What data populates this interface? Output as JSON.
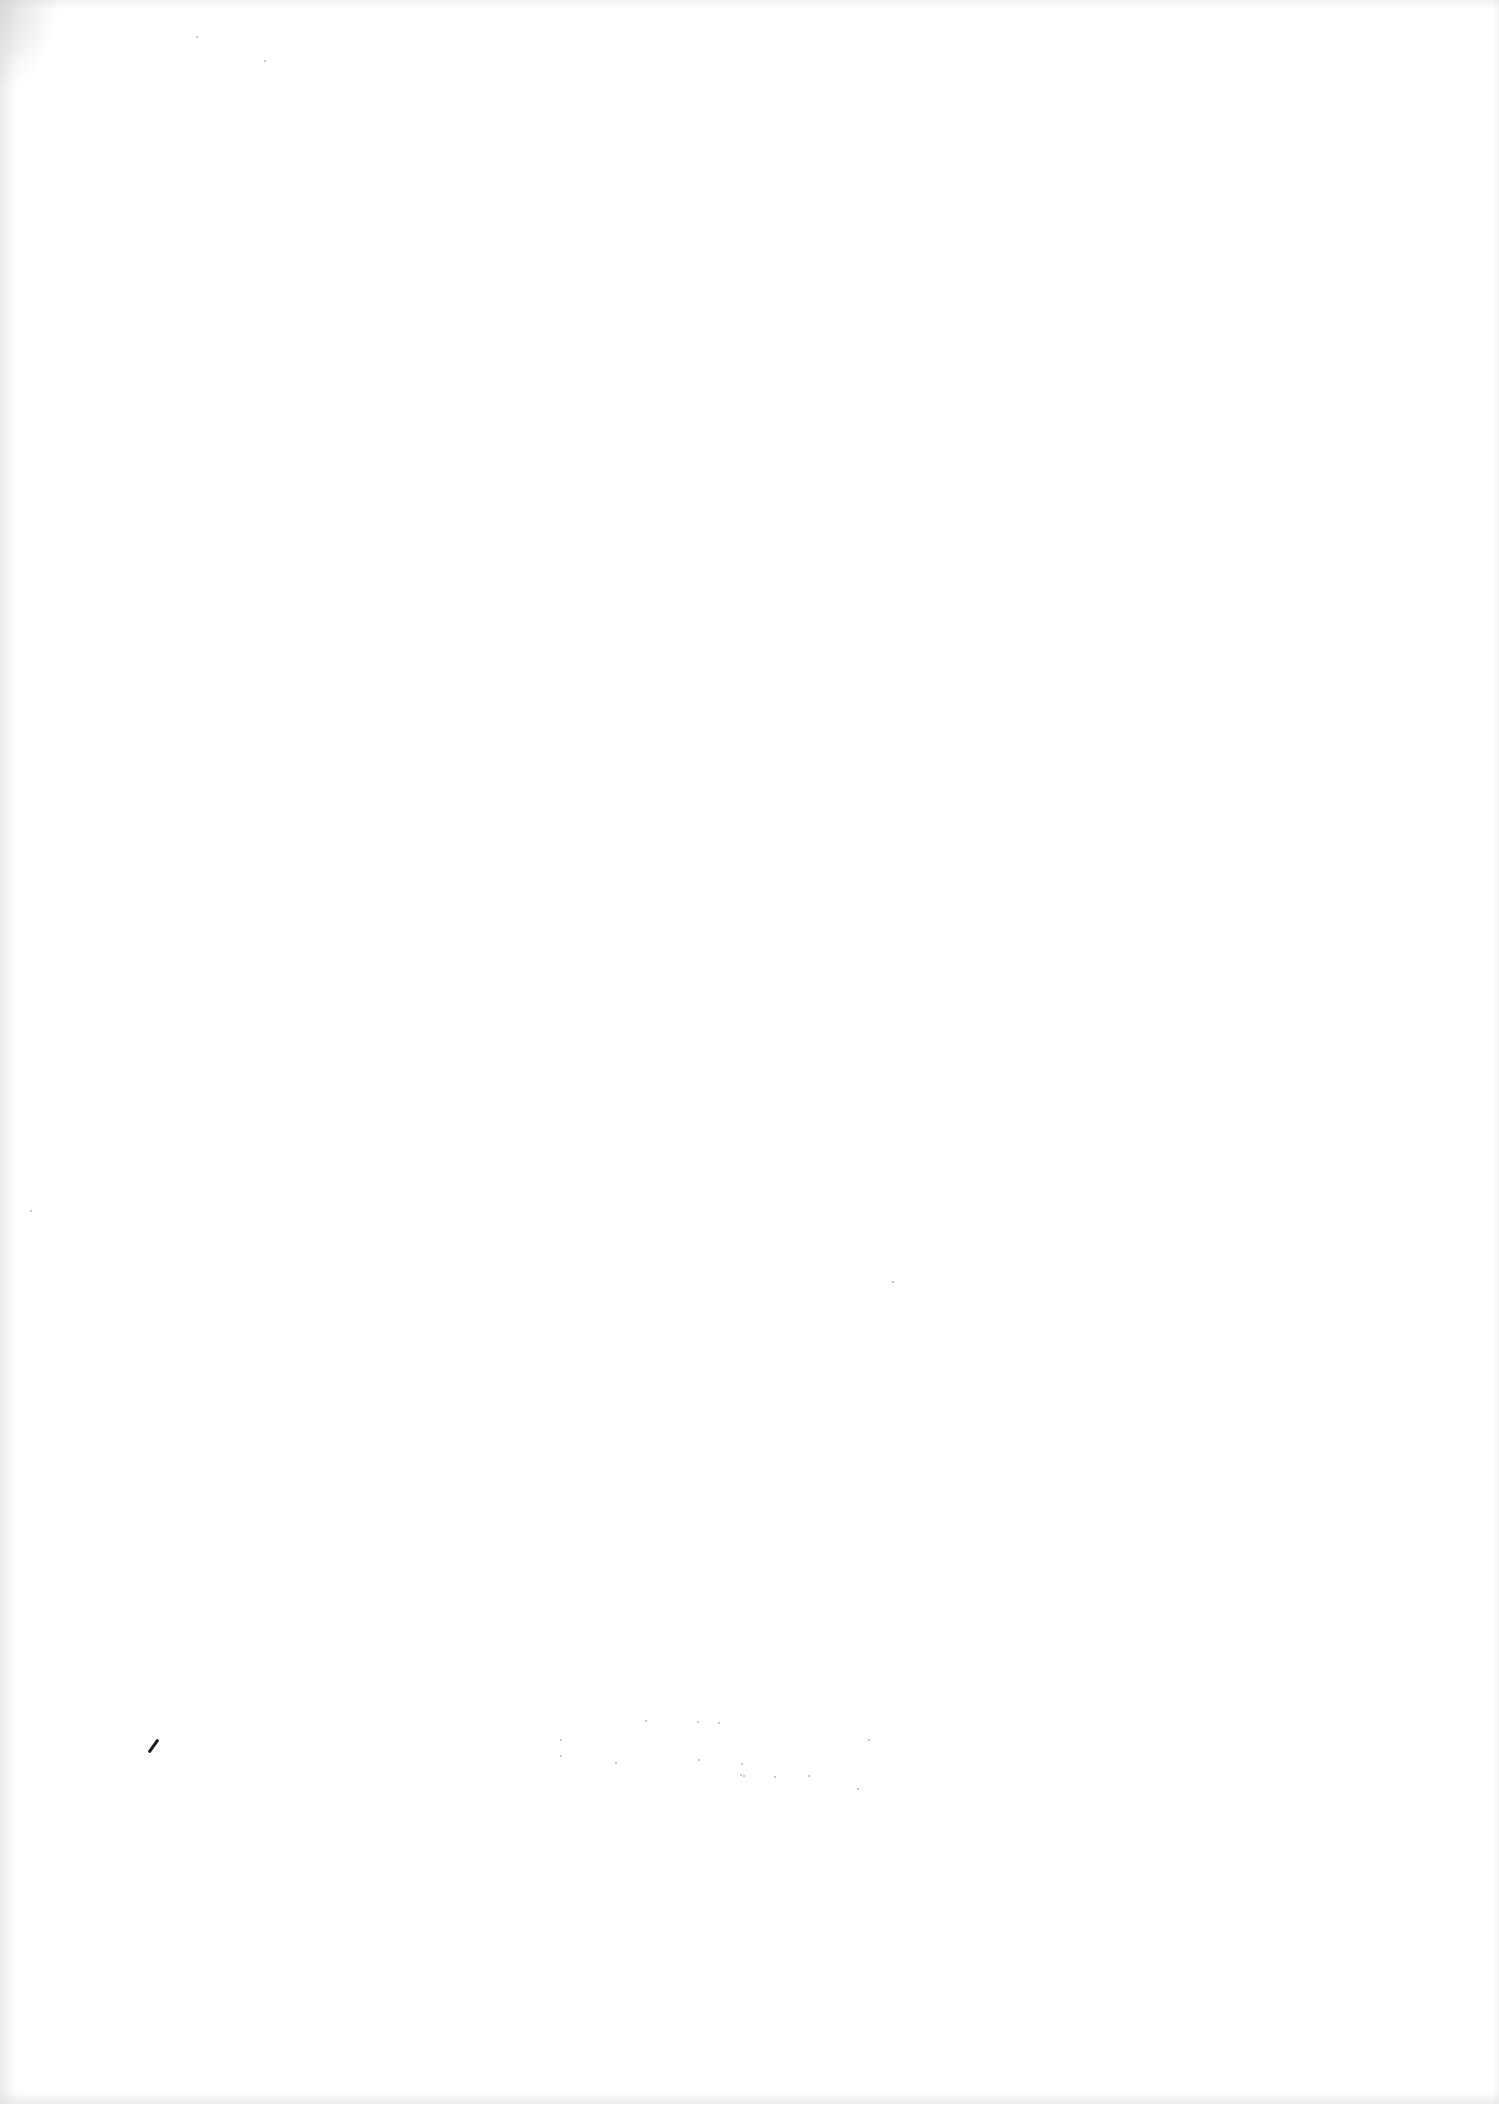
{
  "document": {
    "type": "scanned-blank-page",
    "background_color": "#ffffff",
    "text_content": [],
    "marks": [
      {
        "kind": "stray-stroke",
        "x": 152,
        "y": 1738,
        "color": "#1a1a1a"
      }
    ],
    "specks": [
      {
        "x": 560,
        "y": 1755
      },
      {
        "x": 615,
        "y": 1762
      },
      {
        "x": 645,
        "y": 1720
      },
      {
        "x": 697,
        "y": 1721
      },
      {
        "x": 698,
        "y": 1759
      },
      {
        "x": 741,
        "y": 1763
      },
      {
        "x": 740,
        "y": 1774
      },
      {
        "x": 743,
        "y": 1775
      },
      {
        "x": 774,
        "y": 1776
      },
      {
        "x": 808,
        "y": 1775
      },
      {
        "x": 868,
        "y": 1739
      },
      {
        "x": 857,
        "y": 1788
      },
      {
        "x": 718,
        "y": 1722
      },
      {
        "x": 560,
        "y": 1739
      },
      {
        "x": 892,
        "y": 1281
      },
      {
        "x": 196,
        "y": 36
      },
      {
        "x": 264,
        "y": 60
      },
      {
        "x": 30,
        "y": 1210
      }
    ]
  }
}
